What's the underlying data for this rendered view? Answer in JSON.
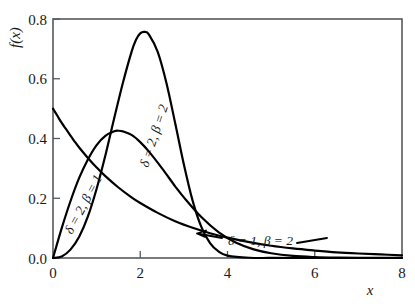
{
  "chart_data": {
    "type": "line",
    "title": "",
    "subtitle": "",
    "xlabel": "x",
    "ylabel": "f(x)",
    "xlim": [
      0,
      8
    ],
    "ylim": [
      0,
      0.8
    ],
    "xticks": [
      0,
      2,
      4,
      6,
      8
    ],
    "xticklabels": [
      "0",
      "2",
      "4",
      "6",
      "8"
    ],
    "yticks": [
      0.0,
      0.2,
      0.4,
      0.6,
      0.8
    ],
    "yticklabels": [
      "0.0",
      "0.2",
      "0.4",
      "0.6",
      "0.8"
    ],
    "grid": false,
    "legend_position": "inline-annotations",
    "frame": "box",
    "tick_direction": "in",
    "series": [
      {
        "name": "delta = 1, beta = 2",
        "label": "δ = 1, β = 2",
        "color": "#000000",
        "x": [
          0.0,
          0.1,
          0.2,
          0.3,
          0.4,
          0.5,
          0.6,
          0.8,
          1.0,
          1.2,
          1.5,
          1.8,
          2.0,
          2.4,
          2.8,
          3.2,
          3.6,
          4.0,
          4.5,
          5.0,
          5.5,
          6.0,
          6.5,
          7.0,
          7.5,
          8.0
        ],
        "y": [
          0.5,
          0.476,
          0.452,
          0.431,
          0.41,
          0.389,
          0.37,
          0.335,
          0.303,
          0.274,
          0.236,
          0.203,
          0.184,
          0.151,
          0.123,
          0.101,
          0.083,
          0.068,
          0.053,
          0.041,
          0.032,
          0.025,
          0.019,
          0.015,
          0.012,
          0.009
        ]
      },
      {
        "name": "delta = 2, beta = 1",
        "label": "δ = 2, β = 1",
        "color": "#000000",
        "x": [
          0.0,
          0.2,
          0.4,
          0.6,
          0.8,
          1.0,
          1.2,
          1.4,
          1.5,
          1.6,
          1.8,
          2.0,
          2.2,
          2.5,
          2.8,
          3.0,
          3.4,
          3.8,
          4.2,
          4.6,
          5.0,
          5.5,
          6.0,
          6.5,
          7.0,
          7.5,
          8.0
        ],
        "y": [
          0.0,
          0.1,
          0.19,
          0.268,
          0.33,
          0.378,
          0.409,
          0.424,
          0.426,
          0.424,
          0.412,
          0.388,
          0.356,
          0.3,
          0.24,
          0.203,
          0.137,
          0.086,
          0.051,
          0.029,
          0.016,
          0.007,
          0.003,
          0.0012,
          0.0005,
          0.0002,
          0.0001
        ]
      },
      {
        "name": "delta = 2, beta = 2",
        "label": "δ = 2, β = 2",
        "color": "#000000",
        "x": [
          0.0,
          0.2,
          0.4,
          0.6,
          0.8,
          1.0,
          1.2,
          1.4,
          1.6,
          1.8,
          1.9,
          2.0,
          2.1,
          2.2,
          2.4,
          2.6,
          2.8,
          3.0,
          3.2,
          3.4,
          3.6,
          3.8,
          4.0,
          4.5,
          5.0,
          6.0,
          7.0,
          8.0
        ],
        "y": [
          0.0,
          0.005,
          0.028,
          0.071,
          0.139,
          0.232,
          0.343,
          0.466,
          0.585,
          0.69,
          0.73,
          0.752,
          0.757,
          0.748,
          0.69,
          0.586,
          0.452,
          0.313,
          0.192,
          0.104,
          0.05,
          0.021,
          0.008,
          0.0008,
          0.0001,
          0.0,
          0.0,
          0.0
        ]
      }
    ],
    "annotations": [
      {
        "text": "δ = 2, β = 1",
        "name": "curve-label-delta2-beta1",
        "x_px": 72,
        "y_px": 235,
        "rotation": -62
      },
      {
        "text": "δ = 2, β = 2",
        "name": "curve-label-delta2-beta2",
        "x_px": 148,
        "y_px": 168,
        "rotation": -72
      },
      {
        "text": "δ = 1, β = 2",
        "name": "curve-label-delta1-beta2",
        "x_px": 228,
        "y_px": 245,
        "rotation": 0,
        "has_leader": true
      }
    ]
  },
  "plot_box": {
    "left_px": 53,
    "top_px": 19,
    "right_px": 402,
    "bottom_px": 258
  }
}
